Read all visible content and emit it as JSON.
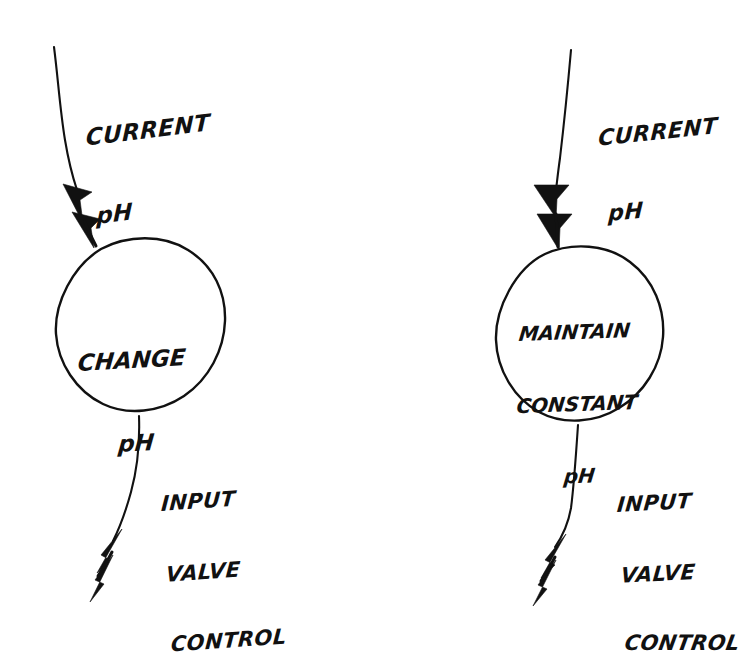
{
  "diagram": {
    "background_color": "#ffffff",
    "ink_color": "#111111",
    "nodes": [
      {
        "id": "change-ph",
        "shape": "circle",
        "lines": [
          "CHANGE",
          "pH"
        ],
        "line1": "CHANGE",
        "line2": "pH",
        "input_label": {
          "line1": "CURRENT",
          "line2": "pH"
        },
        "output_label": {
          "line1": "INPUT",
          "line2": "VALVE",
          "line3": "CONTROL"
        }
      },
      {
        "id": "maintain-constant-ph",
        "shape": "circle",
        "lines": [
          "MAINTAIN",
          "CONSTANT",
          "pH"
        ],
        "line1": "MAINTAIN",
        "line2": "CONSTANT",
        "line3": "pH",
        "input_label": {
          "line1": "CURRENT",
          "line2": "pH"
        },
        "output_label": {
          "line1": "INPUT",
          "line2": "VALVE",
          "line3": "CONTROL"
        }
      }
    ],
    "edges": [
      {
        "id": "left-input-arrow",
        "from": "CURRENT pH",
        "to": "CHANGE pH",
        "style": "double-arrowhead"
      },
      {
        "id": "left-output-arrow",
        "from": "CHANGE pH",
        "to": "INPUT VALVE CONTROL",
        "style": "double-arrowhead"
      },
      {
        "id": "right-input-arrow",
        "from": "CURRENT pH",
        "to": "MAINTAIN CONSTANT pH",
        "style": "double-arrowhead"
      },
      {
        "id": "right-output-arrow",
        "from": "MAINTAIN CONSTANT pH",
        "to": "INPUT VALVE CONTROL",
        "style": "double-arrowhead"
      }
    ]
  }
}
